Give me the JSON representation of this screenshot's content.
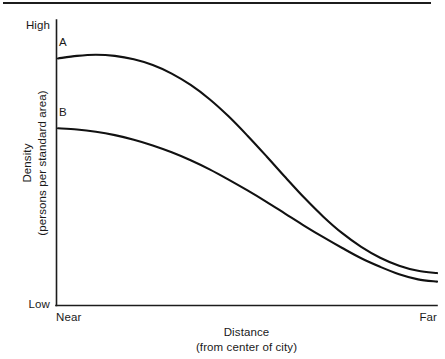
{
  "figure": {
    "top_rule": "horizontal-rule"
  },
  "axes": {
    "y_title_line1": "Density",
    "y_title_line2": "(persons per standard area)",
    "x_title_line1": "Distance",
    "x_title_line2": "(from center of city)",
    "y_tick_high": "High",
    "y_tick_low": "Low",
    "x_tick_near": "Near",
    "x_tick_far": "Far"
  },
  "curve_labels": {
    "a": "A",
    "b": "B"
  },
  "colors": {
    "curve": "#111111",
    "axis": "#1c1c1c",
    "text": "#1a1a1a",
    "background": "#ffffff"
  },
  "chart_data": {
    "type": "line",
    "title": "",
    "xlabel": "Distance (from center of city)",
    "ylabel": "Density (persons per standard area)",
    "xlim": [
      0,
      100
    ],
    "ylim": [
      0,
      100
    ],
    "x_tick_labels": [
      "Near",
      "Far"
    ],
    "y_tick_labels": [
      "Low",
      "High"
    ],
    "grid": false,
    "legend": "inline-curve-labels",
    "x": [
      0,
      5,
      10,
      15,
      20,
      25,
      30,
      35,
      40,
      45,
      50,
      55,
      60,
      65,
      70,
      75,
      80,
      85,
      90,
      95,
      100
    ],
    "series": [
      {
        "name": "A",
        "label_position": "upper-left",
        "values": [
          86.5,
          87.4,
          87.8,
          87.4,
          86.2,
          84.2,
          81.2,
          77.2,
          72.2,
          66.2,
          59.4,
          52.2,
          44.8,
          37.6,
          31.0,
          25.2,
          20.4,
          16.6,
          13.8,
          12.0,
          11.2
        ]
      },
      {
        "name": "B",
        "label_position": "mid-left",
        "values": [
          62.0,
          61.6,
          60.8,
          59.6,
          58.0,
          56.0,
          53.6,
          50.8,
          47.6,
          44.0,
          40.2,
          36.2,
          32.0,
          27.8,
          23.8,
          20.0,
          16.4,
          13.4,
          10.8,
          9.0,
          8.2
        ]
      }
    ],
    "annotations": [
      "Curve A is consistently above curve B at all distances.",
      "Both curves decline from high density near the city center to low density far away.",
      "The two curves converge toward the far end of the distance axis."
    ]
  }
}
